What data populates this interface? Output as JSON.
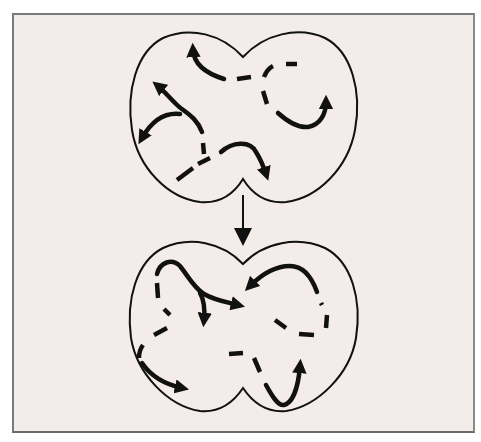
{
  "diagram": {
    "background_color": "#f4ecea",
    "frame_border_color": "#7a7a7a",
    "stroke_color": "#111111",
    "top_panel": {
      "label": "",
      "solid_arrows": 5,
      "dashed_segments": 8
    },
    "transition_arrow": {
      "direction": "down"
    },
    "bottom_panel": {
      "label": "",
      "solid_arrows": 6,
      "dashed_segments": 10
    }
  }
}
